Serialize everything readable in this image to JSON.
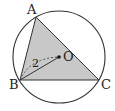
{
  "diagram": {
    "type": "inscribed-triangle",
    "labels": {
      "A": "A",
      "B": "B",
      "C": "C",
      "O": "O",
      "radius": "2"
    },
    "colors": {
      "fill": "#c8c8c8",
      "stroke": "#333333"
    }
  }
}
